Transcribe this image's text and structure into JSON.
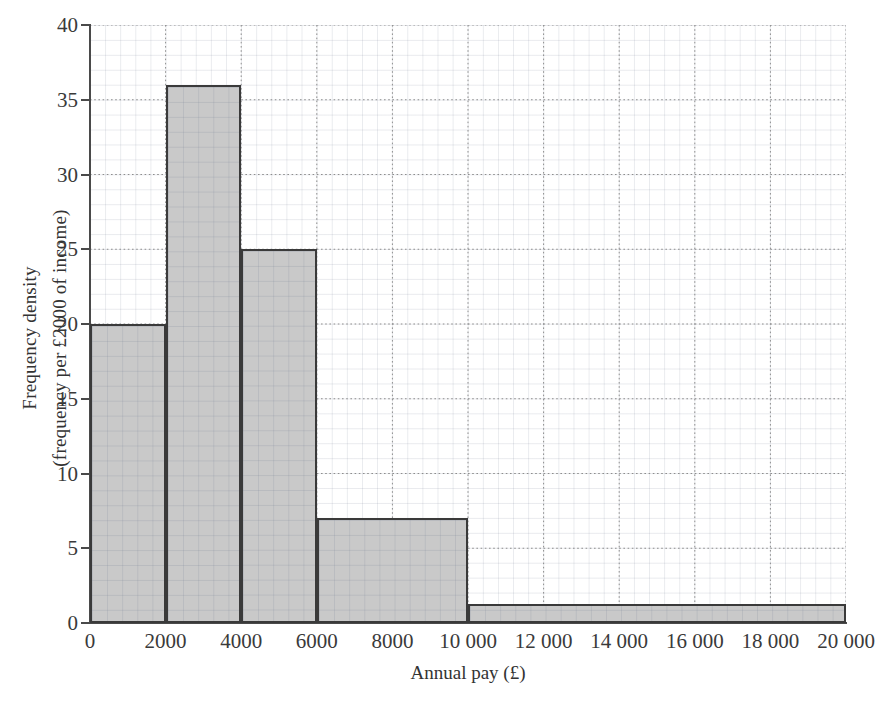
{
  "chart_data": {
    "type": "bar",
    "title": "",
    "subtitle": "",
    "xlabel": "Annual pay (£)",
    "ylabel_line1": "Frequency density",
    "ylabel_line2": "(frequency per £2000 of income)",
    "xlim": [
      0,
      20000
    ],
    "ylim": [
      0,
      40
    ],
    "grid": true,
    "grid_style": "graph paper, minor squares with major dotted gridlines",
    "legend": "none",
    "bar_fill_color": "#c9c9c9",
    "bar_edge_color": "#3a3a3a",
    "xticks": [
      0,
      2000,
      4000,
      6000,
      8000,
      10000,
      12000,
      14000,
      16000,
      18000,
      20000
    ],
    "xticklabels": [
      "0",
      "2000",
      "4000",
      "6000",
      "8000",
      "10 000",
      "12 000",
      "14 000",
      "16 000",
      "18 000",
      "20 000"
    ],
    "yticks": [
      0,
      5,
      10,
      15,
      20,
      25,
      30,
      35,
      40
    ],
    "yticklabels": [
      "0",
      "5",
      "10",
      "15",
      "20",
      "25",
      "30",
      "35",
      "40"
    ],
    "bins": [
      {
        "label": "0–2000",
        "x0": 0,
        "x1": 2000,
        "value": 20
      },
      {
        "label": "2000–4000",
        "x0": 2000,
        "x1": 4000,
        "value": 36
      },
      {
        "label": "4000–6000",
        "x0": 4000,
        "x1": 6000,
        "value": 25
      },
      {
        "label": "6000–10 000",
        "x0": 6000,
        "x1": 10000,
        "value": 7
      },
      {
        "label": "10 000–20 000",
        "x0": 10000,
        "x1": 20000,
        "value": 1.25
      }
    ],
    "categories": [
      "0–2000",
      "2000–4000",
      "4000–6000",
      "6000–10 000",
      "10 000–20 000"
    ],
    "values": [
      20,
      36,
      25,
      7,
      1.25
    ]
  }
}
